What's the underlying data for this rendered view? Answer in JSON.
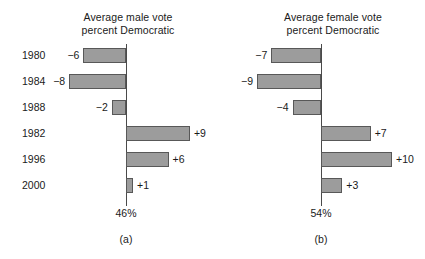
{
  "chart_data": [
    {
      "type": "bar",
      "title": "Average male vote percent Democratic",
      "title_lines": [
        "Average male vote",
        "percent Democratic"
      ],
      "caption": "(a)",
      "orientation": "horizontal",
      "baseline_label": "46%",
      "baseline_value": 46,
      "xlabel": "",
      "ylabel": "",
      "grid": false,
      "legend": "none",
      "xlim": [
        -10,
        11
      ],
      "categories": [
        "1980",
        "1984",
        "1988",
        "1982",
        "1996",
        "2000"
      ],
      "values": [
        -6,
        -8,
        -2,
        9,
        6,
        1
      ],
      "value_labels": [
        "−6",
        "−8",
        "−2",
        "+9",
        "+6",
        "+1"
      ]
    },
    {
      "type": "bar",
      "title": "Average female vote percent Democratic",
      "title_lines": [
        "Average female vote",
        "percent Democratic"
      ],
      "caption": "(b)",
      "orientation": "horizontal",
      "baseline_label": "54%",
      "baseline_value": 54,
      "xlabel": "",
      "ylabel": "",
      "grid": false,
      "legend": "none",
      "xlim": [
        -10,
        11
      ],
      "categories": [
        "1980",
        "1984",
        "1988",
        "1982",
        "1996",
        "2000"
      ],
      "values": [
        -7,
        -9,
        -4,
        7,
        10,
        3
      ],
      "value_labels": [
        "−7",
        "−9",
        "−4",
        "+7",
        "+10",
        "+3"
      ]
    }
  ],
  "panel_a": {
    "title_line1": "Average male vote",
    "title_line2": "percent Democratic",
    "caption": "(a)",
    "baseline": "46%",
    "rows": [
      {
        "year": "1980",
        "value": -6,
        "label": "−6"
      },
      {
        "year": "1984",
        "value": -8,
        "label": "−8"
      },
      {
        "year": "1988",
        "value": -2,
        "label": "−2"
      },
      {
        "year": "1982",
        "value": 9,
        "label": "+9"
      },
      {
        "year": "1996",
        "value": 6,
        "label": "+6"
      },
      {
        "year": "2000",
        "value": 1,
        "label": "+1"
      }
    ]
  },
  "panel_b": {
    "title_line1": "Average female vote",
    "title_line2": "percent Democratic",
    "caption": "(b)",
    "baseline": "54%",
    "rows": [
      {
        "year": "",
        "value": -7,
        "label": "−7"
      },
      {
        "year": "",
        "value": -9,
        "label": "−9"
      },
      {
        "year": "",
        "value": -4,
        "label": "−4"
      },
      {
        "year": "",
        "value": 7,
        "label": "+7"
      },
      {
        "year": "",
        "value": 10,
        "label": "+10"
      },
      {
        "year": "",
        "value": 3,
        "label": "+3"
      }
    ]
  },
  "style": {
    "bar_fill": "#9c9c9c",
    "bar_stroke": "#585858",
    "axis_color": "#4a4a4a",
    "text_color": "#1a1a1a",
    "background": "#ffffff"
  }
}
